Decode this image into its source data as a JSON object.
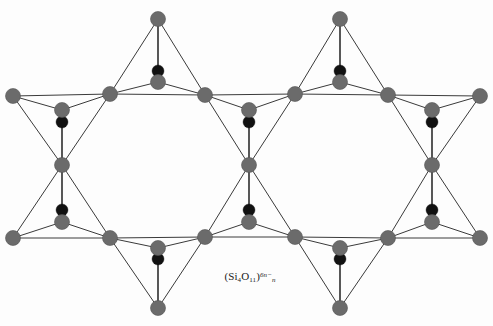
{
  "figure": {
    "background_color": "#fdfdfd",
    "width": 493,
    "height": 326,
    "formula": {
      "open_paren": "(",
      "element_1": "Si",
      "sub_1": "4",
      "element_2": "O",
      "sub_2": "11",
      "close_paren": ")",
      "chain_subscript": "n",
      "charge": "6n−",
      "plain_text": "(Si4O11)n6n−"
    },
    "colors": {
      "node_gray": "#6b6b6b",
      "node_gray_stroke": "#545454",
      "apex_black": "#111111",
      "bond_line": "#3a3a3a",
      "background": "#fdfdfd",
      "text": "#1b1b1b"
    },
    "geometry": {
      "node_radius": 7.5,
      "apex_radius": 6.0,
      "bond_width": 1.0,
      "vertical_bond_width": 1.7
    },
    "legend_semantics": {
      "gray_circle": "silicon-oxygen tetrahedron corner atom (in plane)",
      "black_circle": "apex oxygen atom (above plane, shown with vertical bond)"
    },
    "nodes": {
      "top_apex": [
        {
          "x": 158,
          "y": 19,
          "name": "top-apex-node-1"
        },
        {
          "x": 340,
          "y": 19,
          "name": "top-apex-node-2"
        }
      ],
      "bottom_apex": [
        {
          "x": 158,
          "y": 308,
          "name": "bottom-apex-node-1"
        },
        {
          "x": 340,
          "y": 308,
          "name": "bottom-apex-node-2"
        }
      ],
      "top_row": [
        {
          "x": 13,
          "y": 96,
          "name": "top-row-node-1"
        },
        {
          "x": 110,
          "y": 94,
          "name": "top-row-node-2"
        },
        {
          "x": 205,
          "y": 95,
          "name": "top-row-node-3"
        },
        {
          "x": 295,
          "y": 94,
          "name": "top-row-node-4"
        },
        {
          "x": 388,
          "y": 95,
          "name": "top-row-node-5"
        },
        {
          "x": 480,
          "y": 96,
          "name": "top-row-node-6"
        }
      ],
      "bottom_row": [
        {
          "x": 13,
          "y": 238,
          "name": "bottom-row-node-1"
        },
        {
          "x": 110,
          "y": 238,
          "name": "bottom-row-node-2"
        },
        {
          "x": 205,
          "y": 237,
          "name": "bottom-row-node-3"
        },
        {
          "x": 295,
          "y": 237,
          "name": "bottom-row-node-4"
        },
        {
          "x": 388,
          "y": 238,
          "name": "bottom-row-node-5"
        },
        {
          "x": 480,
          "y": 238,
          "name": "bottom-row-node-6"
        }
      ],
      "inner_upper": [
        {
          "x": 62,
          "y": 110,
          "name": "inner-upper-node-1"
        },
        {
          "x": 158,
          "y": 82,
          "name": "inner-upper-node-2"
        },
        {
          "x": 249,
          "y": 110,
          "name": "inner-upper-node-3"
        },
        {
          "x": 340,
          "y": 82,
          "name": "inner-upper-node-4"
        },
        {
          "x": 432,
          "y": 110,
          "name": "inner-upper-node-5"
        }
      ],
      "inner_lower": [
        {
          "x": 62,
          "y": 222,
          "name": "inner-lower-node-1"
        },
        {
          "x": 158,
          "y": 248,
          "name": "inner-lower-node-2"
        },
        {
          "x": 249,
          "y": 222,
          "name": "inner-lower-node-3"
        },
        {
          "x": 340,
          "y": 248,
          "name": "inner-lower-node-4"
        },
        {
          "x": 432,
          "y": 222,
          "name": "inner-lower-node-5"
        }
      ],
      "mid_junctions": [
        {
          "x": 62,
          "y": 165,
          "name": "mid-junction-node-1"
        },
        {
          "x": 249,
          "y": 165,
          "name": "mid-junction-node-2"
        },
        {
          "x": 432,
          "y": 165,
          "name": "mid-junction-node-3"
        }
      ],
      "apex_oxygens": [
        {
          "x": 158,
          "y": 71,
          "name": "apex-oxygen-top-center-1"
        },
        {
          "x": 340,
          "y": 71,
          "name": "apex-oxygen-top-center-2"
        },
        {
          "x": 62,
          "y": 122,
          "name": "apex-oxygen-upper-left"
        },
        {
          "x": 249,
          "y": 122,
          "name": "apex-oxygen-upper-mid"
        },
        {
          "x": 432,
          "y": 122,
          "name": "apex-oxygen-upper-right"
        },
        {
          "x": 62,
          "y": 210,
          "name": "apex-oxygen-lower-left"
        },
        {
          "x": 249,
          "y": 210,
          "name": "apex-oxygen-lower-mid"
        },
        {
          "x": 432,
          "y": 210,
          "name": "apex-oxygen-lower-right"
        },
        {
          "x": 158,
          "y": 259,
          "name": "apex-oxygen-bottom-center-1"
        },
        {
          "x": 340,
          "y": 259,
          "name": "apex-oxygen-bottom-center-2"
        }
      ]
    },
    "bonds": [
      [
        13,
        96,
        110,
        94
      ],
      [
        110,
        94,
        205,
        95
      ],
      [
        205,
        95,
        295,
        94
      ],
      [
        295,
        94,
        388,
        95
      ],
      [
        388,
        95,
        480,
        96
      ],
      [
        13,
        238,
        110,
        238
      ],
      [
        110,
        238,
        205,
        237
      ],
      [
        205,
        237,
        295,
        237
      ],
      [
        295,
        237,
        388,
        238
      ],
      [
        388,
        238,
        480,
        238
      ],
      [
        158,
        19,
        110,
        94
      ],
      [
        158,
        19,
        205,
        95
      ],
      [
        158,
        19,
        158,
        82
      ],
      [
        340,
        19,
        295,
        94
      ],
      [
        340,
        19,
        388,
        95
      ],
      [
        340,
        19,
        340,
        82
      ],
      [
        158,
        308,
        110,
        238
      ],
      [
        158,
        308,
        205,
        237
      ],
      [
        158,
        308,
        158,
        248
      ],
      [
        340,
        308,
        295,
        237
      ],
      [
        340,
        308,
        388,
        238
      ],
      [
        340,
        308,
        340,
        248
      ],
      [
        110,
        94,
        158,
        82
      ],
      [
        158,
        82,
        205,
        95
      ],
      [
        295,
        94,
        340,
        82
      ],
      [
        340,
        82,
        388,
        95
      ],
      [
        110,
        238,
        158,
        248
      ],
      [
        158,
        248,
        205,
        237
      ],
      [
        295,
        237,
        340,
        248
      ],
      [
        340,
        248,
        388,
        238
      ],
      [
        13,
        96,
        62,
        110
      ],
      [
        62,
        110,
        110,
        94
      ],
      [
        205,
        95,
        249,
        110
      ],
      [
        249,
        110,
        295,
        94
      ],
      [
        388,
        95,
        432,
        110
      ],
      [
        432,
        110,
        480,
        96
      ],
      [
        13,
        238,
        62,
        222
      ],
      [
        62,
        222,
        110,
        238
      ],
      [
        205,
        237,
        249,
        222
      ],
      [
        249,
        222,
        295,
        237
      ],
      [
        388,
        238,
        432,
        222
      ],
      [
        432,
        222,
        480,
        238
      ],
      [
        13,
        96,
        62,
        165
      ],
      [
        110,
        94,
        62,
        165
      ],
      [
        62,
        110,
        62,
        165
      ],
      [
        205,
        95,
        249,
        165
      ],
      [
        295,
        94,
        249,
        165
      ],
      [
        249,
        110,
        249,
        165
      ],
      [
        388,
        95,
        432,
        165
      ],
      [
        480,
        96,
        432,
        165
      ],
      [
        432,
        110,
        432,
        165
      ],
      [
        13,
        238,
        62,
        165
      ],
      [
        110,
        238,
        62,
        165
      ],
      [
        62,
        222,
        62,
        165
      ],
      [
        205,
        237,
        249,
        165
      ],
      [
        295,
        237,
        249,
        165
      ],
      [
        249,
        222,
        249,
        165
      ],
      [
        388,
        238,
        432,
        165
      ],
      [
        480,
        238,
        432,
        165
      ],
      [
        432,
        222,
        432,
        165
      ],
      [
        158,
        82,
        158,
        71
      ],
      [
        340,
        82,
        340,
        71
      ],
      [
        158,
        248,
        158,
        259
      ],
      [
        340,
        248,
        340,
        259
      ]
    ]
  }
}
